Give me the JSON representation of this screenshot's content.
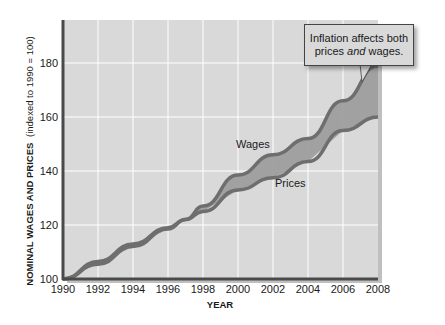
{
  "chart_data": {
    "type": "area",
    "title": "",
    "xlabel": "YEAR",
    "ylabel_bold": "NOMINAL WAGES AND PRICES",
    "ylabel_normal": "(indexed to 1990 = 100)",
    "x": [
      1990,
      1992,
      1994,
      1996,
      1997,
      1998,
      2000,
      2002,
      2004,
      2006,
      2008
    ],
    "series": [
      {
        "name": "Wages",
        "values": [
          100,
          106.5,
          113,
          119,
          122,
          127,
          138.5,
          146,
          152,
          166,
          179
        ]
      },
      {
        "name": "Prices",
        "values": [
          100,
          105.5,
          112,
          118.5,
          122,
          125,
          133,
          137.5,
          143.5,
          155,
          160
        ]
      }
    ],
    "xticks": [
      "1990",
      "1992",
      "1994",
      "1996",
      "1998",
      "2000",
      "2002",
      "2004",
      "2006",
      "2008"
    ],
    "yticks": [
      "100",
      "120",
      "140",
      "160",
      "180"
    ],
    "xlim": [
      1990,
      2008
    ],
    "ylim": [
      100,
      186
    ],
    "grid": true,
    "legend": "inline labels",
    "annotations": [
      {
        "text": "Wages",
        "x": 2001,
        "y": 148
      },
      {
        "text": "Prices",
        "x": 2003,
        "y": 135
      }
    ],
    "shaded_region": "gap between wages and prices"
  },
  "callout": {
    "line1": "Inflation affects both",
    "line2_pre": "prices ",
    "line2_em": "and",
    "line2_post": " wages."
  },
  "colors": {
    "plot_bg": "#d9d9d9",
    "grid": "#ffffff",
    "line": "#6e6e6e",
    "fill": "#9a9a9a",
    "axis": "#4a4a4a"
  }
}
